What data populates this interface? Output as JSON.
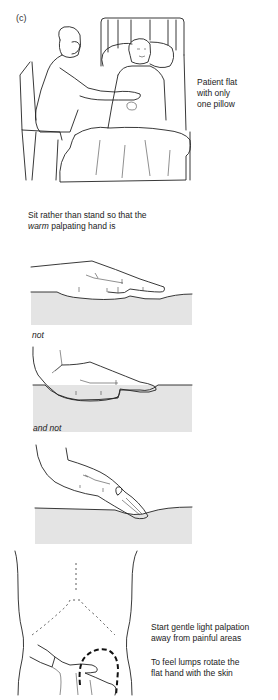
{
  "figure": {
    "label": "(c)"
  },
  "captions": {
    "patient_position": [
      "Patient flat",
      "with only",
      "one pillow"
    ],
    "sit_instruction_prefix": "Sit rather than stand so that the",
    "sit_instruction_emphasis": "warm",
    "sit_instruction_suffix": "palpating hand is",
    "not": "not",
    "and_not": "and not",
    "start_palpation": [
      "Start gentle light palpation",
      "away from painful areas"
    ],
    "feel_lumps": [
      "To feel lumps rotate the",
      "flat hand with the skin"
    ]
  },
  "illustrations": [
    {
      "name": "examiner-seated-bedside",
      "description": "Examiner seated on chair palpating abdomen of patient lying flat in bed"
    },
    {
      "name": "hand-flat-correct",
      "description": "Flat hand resting on skin surface"
    },
    {
      "name": "hand-raised-wrist",
      "description": "Hand with raised wrist on skin surface"
    },
    {
      "name": "hand-fingertips-prodding",
      "description": "Fingertips prodding into skin"
    },
    {
      "name": "abdomen-palpation-diagram",
      "description": "Torso outline with hand palpating, dashed circle indicating lump area"
    }
  ]
}
